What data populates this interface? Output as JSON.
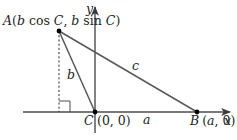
{
  "diagram": {
    "type": "triangle-on-coordinate-plane",
    "axes": {
      "x_label": "x",
      "y_label": "y"
    },
    "points": {
      "A": {
        "name": "A",
        "coords_text": "(b cos C, b sin C)",
        "label_prefix": "A(",
        "b1": "b",
        "cos": " cos ",
        "C1": "C",
        "comma": ", ",
        "b2": "b",
        "sin": " sin ",
        "C2": "C",
        "close": ")"
      },
      "C": {
        "name": "C",
        "coords_text": "(0, 0)"
      },
      "B": {
        "name": "B",
        "coords_text": "(a, 0)",
        "open": "(",
        "a": "a",
        "rest": ", 0)"
      }
    },
    "sides": {
      "a": "a",
      "b": "b",
      "c": "c"
    },
    "colors": {
      "line": "#595959",
      "axis": "#4d4d4d",
      "text": "#231f20",
      "point": "#000000"
    }
  }
}
